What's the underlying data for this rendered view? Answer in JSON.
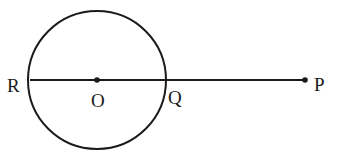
{
  "diagram": {
    "type": "geometry",
    "circle": {
      "center_label": "O",
      "cx": 97,
      "cy": 80,
      "r": 68
    },
    "segment": {
      "from": "R",
      "to": "P"
    },
    "points": [
      {
        "id": "R",
        "label": "R",
        "x": 30,
        "y": 80,
        "on_circle": true
      },
      {
        "id": "O",
        "label": "O",
        "x": 97,
        "y": 80,
        "is_center": true
      },
      {
        "id": "Q",
        "label": "Q",
        "x": 165,
        "y": 80,
        "on_circle": true
      },
      {
        "id": "P",
        "label": "P",
        "x": 305,
        "y": 80,
        "external": true
      }
    ],
    "colors": {
      "stroke": "#1a1a1a",
      "background": "#ffffff"
    }
  }
}
